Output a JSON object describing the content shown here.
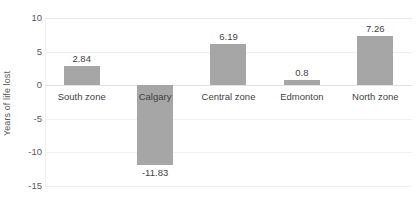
{
  "chart_data": {
    "type": "bar",
    "title": "",
    "xlabel": "",
    "ylabel": "Years of life lost",
    "categories": [
      "South zone",
      "Calgary",
      "Central zone",
      "Edmonton",
      "North zone"
    ],
    "values": [
      2.84,
      -11.83,
      6.19,
      0.8,
      7.26
    ],
    "value_labels": [
      "2.84",
      "-11.83",
      "6.19",
      "0.8",
      "7.26"
    ],
    "ylim": [
      -15,
      10
    ],
    "yticks": [
      10,
      5,
      0,
      -5,
      -10,
      -15
    ],
    "ytick_labels": [
      "10",
      "5",
      "0",
      "-5",
      "-10",
      "-15"
    ],
    "grid": true,
    "legend": "none",
    "bar_color": "#a6a6a6",
    "gridline_color": "#f0f0f0",
    "text_color": "#3f3f3f",
    "axis_text_color": "#595959",
    "background": "#ffffff"
  }
}
